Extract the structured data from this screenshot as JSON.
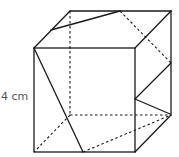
{
  "figure": {
    "type": "cube-with-cross-section",
    "side_label": "4 cm",
    "colors": {
      "line": "#1a1a1a",
      "label": "#555555",
      "background": "#ffffff"
    },
    "vertices": {
      "front_top_left": [
        34,
        48
      ],
      "front_top_right": [
        135,
        48
      ],
      "front_bottom_left": [
        34,
        152
      ],
      "front_bottom_right": [
        135,
        152
      ],
      "back_top_left": [
        70,
        11
      ],
      "back_top_right": [
        171,
        11
      ],
      "back_bottom_left": [
        70,
        115
      ],
      "back_bottom_right": [
        171,
        115
      ]
    },
    "section_points": {
      "top_left_edge": [
        51,
        30
      ],
      "top_back_edge": [
        120,
        11
      ],
      "back_right_edge": [
        171,
        63
      ],
      "front_right_edge": [
        135,
        99
      ],
      "bottom_front_edge": [
        83,
        152
      ]
    }
  }
}
